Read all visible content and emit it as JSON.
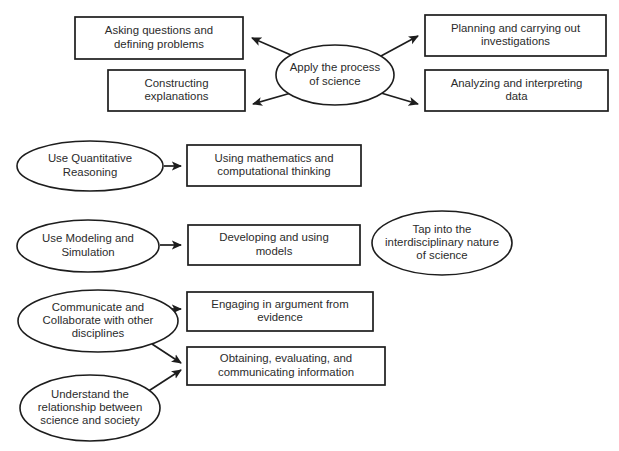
{
  "diagram": {
    "background_color": "#ffffff",
    "stroke_color": "#1d1d1d",
    "text_color": "#2b2b2b",
    "nodes": [
      {
        "id": "asking-questions",
        "shape": "rect",
        "lines": [
          "Asking questions and",
          "defining problems"
        ],
        "x": 75,
        "y": 17,
        "w": 168,
        "h": 42
      },
      {
        "id": "apply-process",
        "shape": "ellipse",
        "lines": [
          "Apply the process",
          "of science"
        ],
        "cx": 335,
        "cy": 75,
        "rx": 59,
        "ry": 30
      },
      {
        "id": "planning-investigations",
        "shape": "rect",
        "lines": [
          "Planning and carrying out",
          "investigations"
        ],
        "x": 425,
        "y": 15,
        "w": 181,
        "h": 41
      },
      {
        "id": "constructing-explanations",
        "shape": "rect",
        "lines": [
          "Constructing",
          "explanations"
        ],
        "x": 108,
        "y": 70,
        "w": 137,
        "h": 41
      },
      {
        "id": "analyzing-data",
        "shape": "rect",
        "lines": [
          "Analyzing and interpreting",
          "data"
        ],
        "x": 425,
        "y": 70,
        "w": 183,
        "h": 41
      },
      {
        "id": "use-quantitative-reasoning",
        "shape": "ellipse",
        "lines": [
          "Use Quantitative",
          "Reasoning"
        ],
        "cx": 90,
        "cy": 166,
        "rx": 73,
        "ry": 25
      },
      {
        "id": "using-mathematics",
        "shape": "rect",
        "lines": [
          "Using mathematics and",
          "computational thinking"
        ],
        "x": 187,
        "y": 145,
        "w": 174,
        "h": 41
      },
      {
        "id": "use-modeling-simulation",
        "shape": "ellipse",
        "lines": [
          "Use Modeling and",
          "Simulation"
        ],
        "cx": 88,
        "cy": 246,
        "rx": 71,
        "ry": 26
      },
      {
        "id": "developing-models",
        "shape": "rect",
        "lines": [
          "Developing and using",
          "models"
        ],
        "x": 188,
        "y": 225,
        "w": 172,
        "h": 40
      },
      {
        "id": "tap-interdisciplinary",
        "shape": "ellipse",
        "lines": [
          "Tap into the",
          "interdisciplinary nature",
          "of science"
        ],
        "cx": 442,
        "cy": 243,
        "rx": 70,
        "ry": 32
      },
      {
        "id": "communicate-collaborate",
        "shape": "ellipse",
        "lines": [
          "Communicate and",
          "Collaborate with other",
          "disciplines"
        ],
        "cx": 98,
        "cy": 321,
        "rx": 80,
        "ry": 31
      },
      {
        "id": "engaging-argument",
        "shape": "rect",
        "lines": [
          "Engaging in argument from",
          "evidence"
        ],
        "x": 187,
        "y": 292,
        "w": 186,
        "h": 39
      },
      {
        "id": "obtaining-evaluating",
        "shape": "rect",
        "lines": [
          "Obtaining, evaluating, and",
          "communicating information"
        ],
        "x": 187,
        "y": 347,
        "w": 198,
        "h": 38
      },
      {
        "id": "understand-relationship",
        "shape": "ellipse",
        "lines": [
          "Understand the",
          "relationship between",
          "science and society"
        ],
        "cx": 90,
        "cy": 408,
        "rx": 70,
        "ry": 33
      }
    ],
    "connectors": [
      {
        "id": "apply-to-asking",
        "from": "apply-process",
        "to": "asking-questions",
        "path": "M 291,55 L 252,38",
        "arrow_at": "end"
      },
      {
        "id": "apply-to-planning",
        "from": "apply-process",
        "to": "planning-investigations",
        "path": "M 381,56 L 418,36",
        "arrow_at": "end"
      },
      {
        "id": "apply-to-constructing",
        "from": "apply-process",
        "to": "constructing-explanations",
        "path": "M 291,93 L 253,104",
        "arrow_at": "end"
      },
      {
        "id": "apply-to-analyzing",
        "from": "apply-process",
        "to": "analyzing-data",
        "path": "M 381,93 L 418,104",
        "arrow_at": "end"
      },
      {
        "id": "quantitative-to-mathematics",
        "from": "use-quantitative-reasoning",
        "to": "using-mathematics",
        "path": "M 164,166 L 181,166",
        "arrow_at": "end"
      },
      {
        "id": "modeling-to-developing",
        "from": "use-modeling-simulation",
        "to": "developing-models",
        "path": "M 160,245 L 181,245",
        "arrow_at": "end"
      },
      {
        "id": "communicate-to-engaging",
        "from": "communicate-collaborate",
        "to": "engaging-argument",
        "path": "M 168,309 L 181,309",
        "arrow_at": "end"
      },
      {
        "id": "communicate-to-obtaining",
        "from": "communicate-collaborate",
        "to": "obtaining-evaluating",
        "path": "M 152,344 L 181,363",
        "arrow_at": "end"
      },
      {
        "id": "understand-to-obtaining",
        "from": "understand-relationship",
        "to": "obtaining-evaluating",
        "path": "M 147,392 L 181,370",
        "arrow_at": "end"
      }
    ]
  }
}
